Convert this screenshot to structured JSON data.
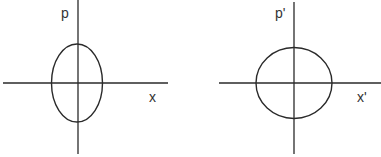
{
  "panels": [
    {
      "name": "original-phase-space",
      "x_label": "x",
      "y_label": "p",
      "shape": "ellipse (elongated along p)"
    },
    {
      "name": "transformed-phase-space",
      "x_label": "x'",
      "y_label": "p'",
      "shape": "circle"
    }
  ]
}
